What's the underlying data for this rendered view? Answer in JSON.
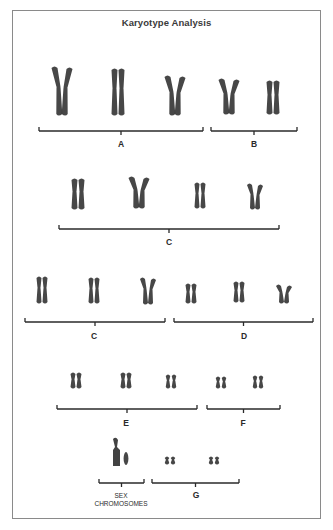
{
  "title": "Karyotype Analysis",
  "colors": {
    "chromosome": "#2e2e2e",
    "bracket": "#2a2a2a",
    "frame": "#8a8a8a"
  },
  "groups": [
    {
      "label": "A",
      "bracket": {
        "x1": 39,
        "x2": 203,
        "y": 131
      },
      "label_pos": {
        "x": 121,
        "y": 139
      },
      "pairs": [
        {
          "x": 62,
          "top": 66,
          "h": 50,
          "bent": true
        },
        {
          "x": 118,
          "top": 68,
          "h": 48,
          "bent": false
        },
        {
          "x": 175,
          "top": 75,
          "h": 41,
          "bent": true
        }
      ]
    },
    {
      "label": "B",
      "bracket": {
        "x1": 211,
        "x2": 297,
        "y": 131
      },
      "label_pos": {
        "x": 254,
        "y": 139
      },
      "pairs": [
        {
          "x": 229,
          "top": 78,
          "h": 37,
          "bent": true
        },
        {
          "x": 273,
          "top": 80,
          "h": 35,
          "bent": false
        }
      ]
    },
    {
      "label": "C",
      "bracket": {
        "x1": 59,
        "x2": 279,
        "y": 229
      },
      "label_pos": {
        "x": 169,
        "y": 237
      },
      "pairs": [
        {
          "x": 78,
          "top": 178,
          "h": 32,
          "bent": false
        },
        {
          "x": 139,
          "top": 176,
          "h": 33,
          "bent": true
        },
        {
          "x": 200,
          "top": 182,
          "h": 27,
          "bent": false
        },
        {
          "x": 255,
          "top": 183,
          "h": 27,
          "bent": true
        }
      ]
    },
    {
      "label": "C",
      "bracket": {
        "x1": 25,
        "x2": 165,
        "y": 322
      },
      "label_pos": {
        "x": 94,
        "y": 331
      },
      "pairs": [
        {
          "x": 42,
          "top": 276,
          "h": 28,
          "bent": false
        },
        {
          "x": 94,
          "top": 277,
          "h": 27,
          "bent": false
        },
        {
          "x": 148,
          "top": 277,
          "h": 28,
          "bent": true
        }
      ]
    },
    {
      "label": "D",
      "bracket": {
        "x1": 174,
        "x2": 313,
        "y": 322
      },
      "label_pos": {
        "x": 244,
        "y": 331
      },
      "pairs": [
        {
          "x": 191,
          "top": 283,
          "h": 21,
          "bent": false
        },
        {
          "x": 239,
          "top": 281,
          "h": 22,
          "bent": false
        },
        {
          "x": 284,
          "top": 284,
          "h": 20,
          "bent": true
        }
      ]
    },
    {
      "label": "E",
      "bracket": {
        "x1": 57,
        "x2": 197,
        "y": 409
      },
      "label_pos": {
        "x": 126,
        "y": 418
      },
      "pairs": [
        {
          "x": 76,
          "top": 372,
          "h": 17,
          "bent": false
        },
        {
          "x": 126,
          "top": 372,
          "h": 17,
          "bent": false
        },
        {
          "x": 171,
          "top": 374,
          "h": 15,
          "bent": false
        }
      ]
    },
    {
      "label": "F",
      "bracket": {
        "x1": 207,
        "x2": 280,
        "y": 409
      },
      "label_pos": {
        "x": 243,
        "y": 418
      },
      "pairs": [
        {
          "x": 221,
          "top": 376,
          "h": 13,
          "bent": false
        },
        {
          "x": 258,
          "top": 375,
          "h": 14,
          "bent": false
        }
      ]
    },
    {
      "label": "G",
      "bracket": {
        "x1": 152,
        "x2": 239,
        "y": 483
      },
      "label_pos": {
        "x": 196,
        "y": 490
      },
      "pairs": [
        {
          "x": 170,
          "top": 456,
          "h": 9,
          "bent": false
        },
        {
          "x": 214,
          "top": 456,
          "h": 9,
          "bent": false
        }
      ]
    }
  ],
  "sex_chromosomes": {
    "label_line1": "SEX",
    "label_line2": "CHROMOSOMES",
    "bracket": {
      "x1": 99,
      "x2": 144,
      "y": 483
    },
    "label_pos": {
      "x": 121,
      "y": 492
    },
    "x_chromosome": {
      "x": 116,
      "top": 438,
      "h": 28
    },
    "y_chromosome": {
      "x": 126,
      "top": 452,
      "h": 13
    }
  }
}
